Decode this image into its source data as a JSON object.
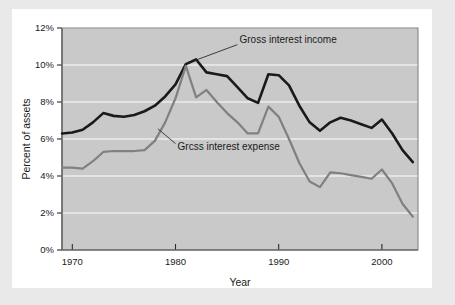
{
  "figure": {
    "background_color": "#e9e9e9",
    "card_color": "#ffffff",
    "plot_background_color": "#c9c9c9",
    "gridline_color": "#ffffff"
  },
  "chart_data": {
    "type": "line",
    "title": "",
    "xlabel": "Year",
    "ylabel": "Percent of assets",
    "xlim": [
      1969,
      2003.5
    ],
    "ylim": [
      0,
      12
    ],
    "xticks": [
      "1970",
      "1980",
      "1990",
      "2000"
    ],
    "xtick_values": [
      1970,
      1980,
      1990,
      2000
    ],
    "yticks": [
      "0%",
      "2%",
      "4%",
      "6%",
      "8%",
      "10%",
      "12%"
    ],
    "ytick_values": [
      0,
      2,
      4,
      6,
      8,
      10,
      12
    ],
    "grid": "horizontal",
    "legend_position": "inline-annotations",
    "x": [
      1969,
      1970,
      1971,
      1972,
      1973,
      1974,
      1975,
      1976,
      1977,
      1978,
      1979,
      1980,
      1981,
      1982,
      1983,
      1984,
      1985,
      1986,
      1987,
      1988,
      1989,
      1990,
      1991,
      1992,
      1993,
      1994,
      1995,
      1996,
      1997,
      1998,
      1999,
      2000,
      2001,
      2002,
      2003
    ],
    "series": [
      {
        "name": "Gross interest income",
        "color": "#1a1a1a",
        "line_width": 2.6,
        "label_text": "Gross interest income",
        "values": [
          6.3,
          6.35,
          6.5,
          6.9,
          7.4,
          7.25,
          7.2,
          7.3,
          7.5,
          7.8,
          8.3,
          8.95,
          10.05,
          10.3,
          9.6,
          9.5,
          9.4,
          8.8,
          8.2,
          7.95,
          9.5,
          9.45,
          8.9,
          7.8,
          6.9,
          6.45,
          6.9,
          7.15,
          7.0,
          6.8,
          6.6,
          7.05,
          6.3,
          5.4,
          4.75
        ]
      },
      {
        "name": "Grcss interest expense",
        "color": "#808080",
        "line_width": 2.2,
        "label_text": "Grcss interest expense",
        "values": [
          4.45,
          4.45,
          4.4,
          4.8,
          5.3,
          5.35,
          5.35,
          5.35,
          5.4,
          5.9,
          6.9,
          8.2,
          9.95,
          8.25,
          8.65,
          8.0,
          7.4,
          6.9,
          6.3,
          6.3,
          7.75,
          7.2,
          6.0,
          4.7,
          3.7,
          3.4,
          4.2,
          4.15,
          4.05,
          3.95,
          3.85,
          4.35,
          3.6,
          2.5,
          1.8
        ]
      }
    ],
    "annotations": [
      {
        "text": "Gross interest income",
        "x": 1986.2,
        "y": 11.35,
        "leader_from": [
          1986.0,
          11.1
        ],
        "leader_to": [
          1981.9,
          10.25
        ]
      },
      {
        "text": "Grcss interest expense",
        "x": 1980.2,
        "y": 5.6,
        "leader_from": [
          1980.0,
          5.75
        ],
        "leader_to": [
          1978.3,
          6.55
        ]
      }
    ]
  }
}
